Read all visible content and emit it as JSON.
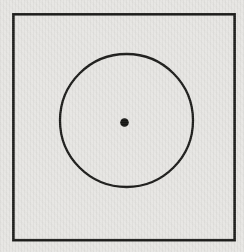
{
  "figure": {
    "canvas": {
      "width": "244",
      "height": "252",
      "viewbox": "0 0 244 252"
    },
    "background_color": "#e7e6e3",
    "stroke_color": "#1d1d1b",
    "dot_color": "#151513",
    "square": {
      "x": "13.4",
      "y": "14.3",
      "width": "221.2",
      "height": "225.9",
      "stroke_width": "2.6"
    },
    "circle": {
      "cx": "126.5",
      "cy": "120.5",
      "r": "66.5",
      "stroke_width": "2.3"
    },
    "center_dot": {
      "cx": "124.5",
      "cy": "122.5",
      "r": "4.3"
    }
  }
}
